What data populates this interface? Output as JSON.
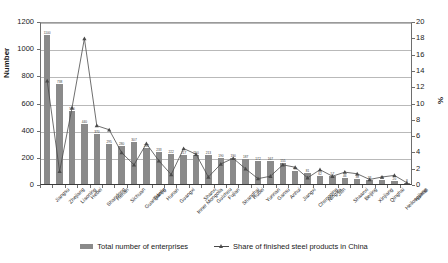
{
  "chart_data": {
    "type": "bar",
    "title": "",
    "xlabel": "",
    "ylabel": "Number",
    "y2label": "%",
    "ylim": [
      0,
      1200
    ],
    "y2lim": [
      0,
      20
    ],
    "grid": true,
    "legend_position": "bottom",
    "y_ticks": [
      "0",
      "200",
      "400",
      "600",
      "800",
      "1000",
      "1200"
    ],
    "y2_ticks": [
      "0",
      "2",
      "4",
      "6",
      "8",
      "10",
      "12",
      "14",
      "16",
      "18",
      "20"
    ],
    "categories": [
      "Jiangsu",
      "Zhejiang",
      "Liaoning",
      "Hebei",
      "Shandong",
      "Henan",
      "Sichuan",
      "Guangdong",
      "Tianjin",
      "Hunan",
      "Guangxi",
      "Inner Mongolia",
      "Shanxi",
      "Guizhou",
      "Fujian",
      "Shanghai",
      "Hubei",
      "Yunnan",
      "Gansu",
      "Anhui",
      "Jiangxi",
      "Chongqing",
      "Ningxia",
      "Jilin",
      "Shaanxi",
      "Beijing",
      "Xinjiang",
      "Qinghai",
      "Heilongjiang",
      "Hainan"
    ],
    "series": [
      {
        "name": "Total number of enterprises",
        "type": "bar",
        "axis": "left",
        "values": [
          1100,
          738,
          540,
          440,
          370,
          295,
          280,
          307,
          264,
          233,
          222,
          217,
          210,
          213,
          190,
          190,
          187,
          172,
          167,
          155,
          95,
          81,
          62,
          57,
          46,
          38,
          33,
          28,
          20,
          8
        ]
      },
      {
        "name": "Share of finished steel products in China",
        "type": "line",
        "axis": "right",
        "values": [
          12.9,
          1.8,
          9.6,
          18.1,
          7.4,
          6.9,
          4.1,
          2.6,
          5.2,
          3.1,
          1.4,
          4.6,
          3.9,
          1.1,
          2.7,
          3.4,
          2.1,
          0.9,
          1.2,
          2.6,
          2.3,
          1.0,
          2.0,
          1.2,
          1.7,
          1.5,
          0.8,
          1.1,
          1.3,
          0.4
        ]
      }
    ]
  },
  "legend": {
    "bar_label": "Total number of enterprises",
    "line_label": "Share of finished steel products in China"
  }
}
